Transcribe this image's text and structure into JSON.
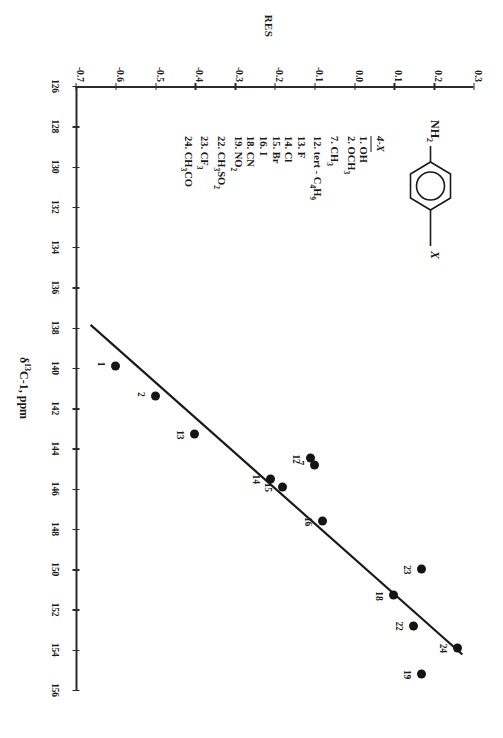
{
  "chart_data": {
    "type": "scatter",
    "title": "",
    "xlabel": "δ 13C-1, ppm",
    "ylabel": "RES",
    "xlim": [
      126,
      156
    ],
    "ylim": [
      -0.7,
      0.3
    ],
    "xticks": [
      126,
      128,
      130,
      132,
      134,
      136,
      138,
      140,
      142,
      144,
      146,
      148,
      150,
      152,
      154,
      156
    ],
    "yticks": [
      0.3,
      0.2,
      0.1,
      0.0,
      -0.1,
      -0.2,
      -0.3,
      -0.4,
      -0.5,
      -0.6,
      -0.7
    ],
    "grid": false,
    "legend_position": "inset-left",
    "points": [
      {
        "label": "1",
        "x": 139.9,
        "y": -0.6
      },
      {
        "label": "2",
        "x": 141.4,
        "y": -0.5
      },
      {
        "label": "13",
        "x": 143.3,
        "y": -0.4
      },
      {
        "label": "12",
        "x": 144.5,
        "y": -0.11
      },
      {
        "label": "7",
        "x": 144.8,
        "y": -0.1
      },
      {
        "label": "14",
        "x": 145.5,
        "y": -0.21
      },
      {
        "label": "15",
        "x": 145.9,
        "y": -0.18
      },
      {
        "label": "16",
        "x": 147.6,
        "y": -0.08
      },
      {
        "label": "23",
        "x": 150.0,
        "y": 0.17
      },
      {
        "label": "18",
        "x": 151.3,
        "y": 0.1
      },
      {
        "label": "22",
        "x": 152.8,
        "y": 0.15
      },
      {
        "label": "24",
        "x": 153.9,
        "y": 0.26
      },
      {
        "label": "19",
        "x": 155.2,
        "y": 0.17
      }
    ],
    "trend_line": {
      "x1": 137.9,
      "y1": -0.66,
      "x2": 154.2,
      "y2": 0.27
    }
  },
  "axis": {
    "x_title_prefix": "δ",
    "x_title_sup": "13",
    "x_title_rest": "C-1, ppm",
    "y_title": "RES"
  },
  "inset": {
    "structure": {
      "left_group": "NH",
      "left_group_sub": "2",
      "right_group": "X"
    },
    "legend_header": "4-X",
    "items": [
      {
        "n": "1.",
        "name": "OH",
        "sub": ""
      },
      {
        "n": "2.",
        "name": "OCH",
        "sub": "3"
      },
      {
        "n": "7.",
        "name": "CH",
        "sub": "3"
      },
      {
        "n": "12.",
        "name": "tert - C",
        "sub": "4",
        "name2": "H",
        "sub2": "9"
      },
      {
        "n": "13.",
        "name": "F",
        "sub": ""
      },
      {
        "n": "14.",
        "name": "Cl",
        "sub": ""
      },
      {
        "n": "15.",
        "name": "Br",
        "sub": ""
      },
      {
        "n": "16.",
        "name": "I",
        "sub": ""
      },
      {
        "n": "18.",
        "name": "CN",
        "sub": ""
      },
      {
        "n": "19.",
        "name": "NO",
        "sub": "2"
      },
      {
        "n": "22.",
        "name": "CH",
        "sub": "3",
        "name2": "SO",
        "sub2": "2"
      },
      {
        "n": "23.",
        "name": "CF",
        "sub": "3"
      },
      {
        "n": "24.",
        "name": "CH",
        "sub": "3",
        "name2": "CO",
        "sub2": ""
      }
    ]
  },
  "colors": {
    "point": "#141414",
    "axis": "#2a2a2a",
    "line": "#1a1a1a",
    "background": "#ffffff"
  }
}
